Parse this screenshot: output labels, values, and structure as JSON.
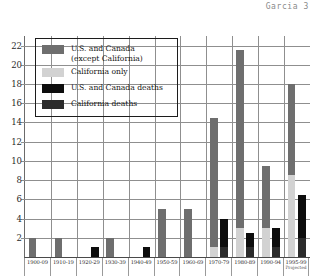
{
  "page": {
    "header": "Garcia 3"
  },
  "legend": {
    "items": [
      {
        "label": "U.S. and Canada\n(except California)",
        "color": "#6e6e6e",
        "key": "us_canada_except_ca"
      },
      {
        "label": "California only",
        "color": "#d2d2d2",
        "key": "california_only"
      },
      {
        "label": "U.S. and Canada deaths",
        "color": "#0d0d0d",
        "key": "us_canada_deaths"
      },
      {
        "label": "California deaths",
        "color": "#2b2b2b",
        "key": "california_deaths"
      }
    ]
  },
  "chart_data": {
    "type": "bar",
    "title": "",
    "xlabel": "",
    "ylabel": "",
    "ylim": [
      0,
      23
    ],
    "yticks": [
      2,
      4,
      6,
      8,
      10,
      12,
      14,
      16,
      18,
      20,
      22
    ],
    "grid": true,
    "legend_position": "upper-left-inside",
    "categories": [
      "1900-09",
      "1910-19",
      "1920-29",
      "1930-39",
      "1940-49",
      "1950-59",
      "1960-69",
      "1970-79",
      "1980-89",
      "1990-94",
      "1995-99"
    ],
    "category_sublabels": [
      "",
      "",
      "",
      "",
      "",
      "",
      "",
      "",
      "",
      "",
      "Projected"
    ],
    "series": [
      {
        "name": "U.S. and Canada (except California)",
        "color": "#6e6e6e",
        "values": [
          2,
          2,
          0,
          2,
          0,
          5,
          5,
          14.5,
          21.5,
          9.5,
          18
        ]
      },
      {
        "name": "California only",
        "color": "#d2d2d2",
        "values": [
          0,
          0,
          0,
          0,
          0,
          0,
          0,
          1,
          3,
          3,
          8.5
        ]
      },
      {
        "name": "U.S. and Canada deaths",
        "color": "#0d0d0d",
        "values": [
          0,
          0,
          1,
          0,
          1,
          0,
          0,
          3,
          1.5,
          2,
          4.5
        ]
      },
      {
        "name": "California deaths",
        "color": "#2b2b2b",
        "values": [
          0,
          0,
          0,
          0,
          0,
          0,
          0,
          1,
          1,
          1,
          2
        ]
      }
    ]
  }
}
